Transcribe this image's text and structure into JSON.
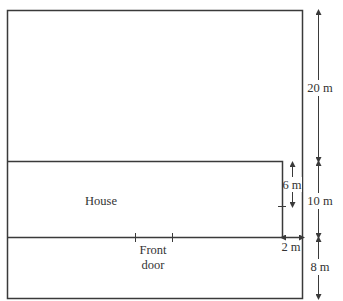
{
  "diagram": {
    "house_label": "House",
    "door_label_line1": "Front",
    "door_label_line2": "door",
    "dimensions": {
      "back_garden_depth": "20 m",
      "house_depth": "10 m",
      "front_garden_depth": "8 m",
      "side_gap": "2 m",
      "door_offset": "6 m"
    },
    "colors": {
      "line": "#3a3a3a",
      "text": "#333333",
      "background": "#ffffff"
    }
  }
}
